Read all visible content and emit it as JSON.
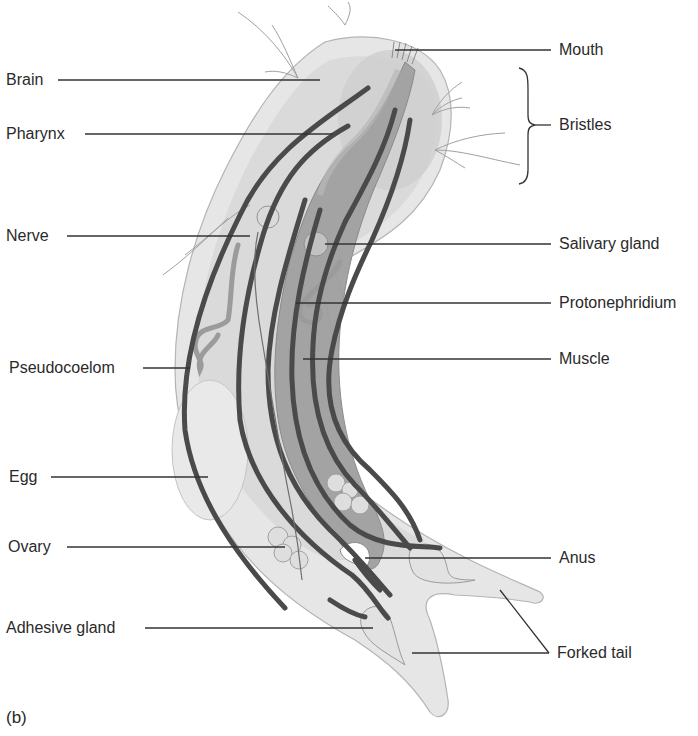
{
  "figure": {
    "panel_letter": "(b)"
  },
  "labels_left": [
    {
      "id": "brain",
      "text": "Brain"
    },
    {
      "id": "pharynx",
      "text": "Pharynx"
    },
    {
      "id": "nerve",
      "text": "Nerve"
    },
    {
      "id": "pseudocoelom",
      "text": "Pseudocoelom"
    },
    {
      "id": "egg",
      "text": "Egg"
    },
    {
      "id": "ovary",
      "text": "Ovary"
    },
    {
      "id": "adhesive-gland",
      "text": "Adhesive gland"
    }
  ],
  "labels_right": [
    {
      "id": "mouth",
      "text": "Mouth"
    },
    {
      "id": "bristles",
      "text": "Bristles"
    },
    {
      "id": "salivary-gland",
      "text": "Salivary gland"
    },
    {
      "id": "protonephridium",
      "text": "Protonephridium"
    },
    {
      "id": "muscle",
      "text": "Muscle"
    },
    {
      "id": "anus",
      "text": "Anus"
    },
    {
      "id": "forked-tail",
      "text": "Forked tail"
    }
  ],
  "colors": {
    "body_outer": "#e4e4e4",
    "body_inner": "#d2d2d2",
    "gut": "#9e9e9e",
    "muscle": "#4a4a4a",
    "leader": "#333333",
    "outline": "#a8a8a8"
  }
}
